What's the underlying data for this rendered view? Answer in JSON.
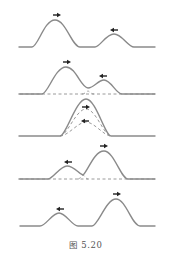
{
  "figure": {
    "caption": "图 5.20",
    "colors": {
      "wave": "#8a8a8a",
      "dashed_component": "#9a9a9a",
      "arrow": "#222222"
    },
    "panels": [
      {
        "index": 1,
        "label": "before overlap",
        "pulses": [
          {
            "size": "large",
            "direction": "right"
          },
          {
            "size": "small",
            "direction": "left"
          }
        ]
      },
      {
        "index": 2,
        "label": "beginning to overlap",
        "pulses": [
          {
            "size": "large",
            "direction": "right"
          },
          {
            "size": "small",
            "direction": "left"
          }
        ],
        "shows_components_dashed": true
      },
      {
        "index": 3,
        "label": "complete overlap",
        "pulses": [
          {
            "size": "large",
            "direction": "right",
            "dashed": true
          },
          {
            "size": "small",
            "direction": "left",
            "dashed": true
          }
        ],
        "resultant": "sum"
      },
      {
        "index": 4,
        "label": "separating",
        "pulses": [
          {
            "size": "small",
            "direction": "left"
          },
          {
            "size": "large",
            "direction": "right"
          }
        ],
        "shows_components_dashed": true
      },
      {
        "index": 5,
        "label": "after passing through",
        "pulses": [
          {
            "size": "small",
            "direction": "left"
          },
          {
            "size": "large",
            "direction": "right"
          }
        ]
      }
    ]
  }
}
